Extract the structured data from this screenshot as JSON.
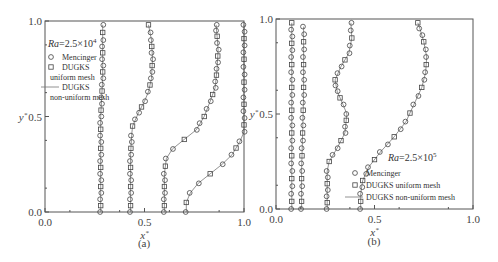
{
  "chart_data": [
    {
      "id": "a",
      "type": "line",
      "subcaption": "(a)",
      "annotation": "Ra=2.5×10⁴",
      "annotation_parts": {
        "prefix": "Ra",
        "text": "=2.5×10",
        "exp": "4"
      },
      "xlabel": "x*",
      "ylabel": "y*",
      "xlim": [
        0,
        1
      ],
      "ylim": [
        0,
        1
      ],
      "xticks": [
        "0.0",
        "0.5",
        "1.0"
      ],
      "yticks": [
        "0.0",
        "0.5",
        "1.0"
      ],
      "grid": false,
      "legend": {
        "position": "upper-left",
        "entries": [
          {
            "marker": "circle",
            "label": "Mencinger"
          },
          {
            "marker": "square",
            "label": "DUGKS"
          },
          {
            "marker": "none",
            "label": "uniform mesh"
          },
          {
            "marker": "line",
            "label": "DUGKS"
          },
          {
            "marker": "none",
            "label": "non-uniform mesh"
          }
        ]
      },
      "series": [
        {
          "name": "profile-1",
          "points": [
            [
              0.28,
              0.0
            ],
            [
              0.28,
              0.1
            ],
            [
              0.28,
              0.2
            ],
            [
              0.28,
              0.3
            ],
            [
              0.28,
              0.4
            ],
            [
              0.28,
              0.5
            ],
            [
              0.285,
              0.6
            ],
            [
              0.29,
              0.7
            ],
            [
              0.29,
              0.8
            ],
            [
              0.29,
              0.9
            ],
            [
              0.29,
              0.98
            ]
          ]
        },
        {
          "name": "profile-2",
          "points": [
            [
              0.43,
              0.0
            ],
            [
              0.43,
              0.1
            ],
            [
              0.43,
              0.2
            ],
            [
              0.43,
              0.3
            ],
            [
              0.435,
              0.4
            ],
            [
              0.44,
              0.45
            ],
            [
              0.47,
              0.52
            ],
            [
              0.5,
              0.58
            ],
            [
              0.52,
              0.63
            ],
            [
              0.535,
              0.7
            ],
            [
              0.54,
              0.8
            ],
            [
              0.535,
              0.9
            ],
            [
              0.52,
              0.98
            ]
          ]
        },
        {
          "name": "profile-3",
          "points": [
            [
              0.6,
              0.0
            ],
            [
              0.6,
              0.1
            ],
            [
              0.6,
              0.2
            ],
            [
              0.61,
              0.28
            ],
            [
              0.64,
              0.33
            ],
            [
              0.7,
              0.38
            ],
            [
              0.76,
              0.43
            ],
            [
              0.8,
              0.5
            ],
            [
              0.83,
              0.58
            ],
            [
              0.855,
              0.65
            ],
            [
              0.865,
              0.75
            ],
            [
              0.87,
              0.85
            ],
            [
              0.865,
              0.92
            ],
            [
              0.86,
              0.98
            ]
          ]
        },
        {
          "name": "profile-4",
          "points": [
            [
              0.71,
              0.0
            ],
            [
              0.71,
              0.05
            ],
            [
              0.73,
              0.1
            ],
            [
              0.77,
              0.15
            ],
            [
              0.83,
              0.2
            ],
            [
              0.89,
              0.25
            ],
            [
              0.94,
              0.3
            ],
            [
              0.98,
              0.37
            ],
            [
              1.0,
              0.42
            ],
            [
              1.0,
              0.6
            ],
            [
              1.0,
              0.8
            ],
            [
              1.0,
              0.98
            ]
          ]
        }
      ]
    },
    {
      "id": "b",
      "type": "line",
      "subcaption": "(b)",
      "annotation": "Ra=2.5×10⁵",
      "annotation_parts": {
        "prefix": "Ra",
        "text": "=2.5×10",
        "exp": "5"
      },
      "xlabel": "x*",
      "ylabel": "y*",
      "xlim": [
        0,
        1
      ],
      "ylim": [
        0,
        1
      ],
      "xticks": [
        "0.0",
        "0.5",
        "1.0"
      ],
      "yticks": [
        "0.0",
        "0.5",
        "1.0"
      ],
      "grid": false,
      "legend": {
        "position": "lower-right",
        "entries": [
          {
            "marker": "circle",
            "label": "Mencinger"
          },
          {
            "marker": "square",
            "label": "DUGKS uniform mesh"
          },
          {
            "marker": "line",
            "label": "DUGKS non-uniform mesh"
          }
        ]
      },
      "series": [
        {
          "name": "profile-1",
          "points": [
            [
              0.08,
              0.0
            ],
            [
              0.08,
              0.2
            ],
            [
              0.08,
              0.4
            ],
            [
              0.08,
              0.6
            ],
            [
              0.08,
              0.8
            ],
            [
              0.08,
              0.98
            ]
          ]
        },
        {
          "name": "profile-2",
          "points": [
            [
              0.13,
              0.0
            ],
            [
              0.13,
              0.2
            ],
            [
              0.135,
              0.4
            ],
            [
              0.14,
              0.6
            ],
            [
              0.14,
              0.8
            ],
            [
              0.14,
              0.96
            ]
          ]
        },
        {
          "name": "profile-3",
          "points": [
            [
              0.26,
              0.0
            ],
            [
              0.26,
              0.1
            ],
            [
              0.26,
              0.2
            ],
            [
              0.27,
              0.25
            ],
            [
              0.31,
              0.32
            ],
            [
              0.35,
              0.4
            ],
            [
              0.36,
              0.5
            ],
            [
              0.34,
              0.55
            ],
            [
              0.31,
              0.62
            ],
            [
              0.3,
              0.68
            ],
            [
              0.33,
              0.75
            ],
            [
              0.37,
              0.82
            ],
            [
              0.385,
              0.9
            ],
            [
              0.38,
              0.98
            ]
          ]
        },
        {
          "name": "profile-4",
          "points": [
            [
              0.43,
              0.0
            ],
            [
              0.43,
              0.08
            ],
            [
              0.44,
              0.15
            ],
            [
              0.47,
              0.22
            ],
            [
              0.53,
              0.3
            ],
            [
              0.6,
              0.38
            ],
            [
              0.66,
              0.46
            ],
            [
              0.7,
              0.55
            ],
            [
              0.74,
              0.64
            ],
            [
              0.76,
              0.72
            ],
            [
              0.765,
              0.8
            ],
            [
              0.75,
              0.88
            ],
            [
              0.73,
              0.95
            ],
            [
              0.72,
              0.98
            ]
          ]
        }
      ]
    }
  ]
}
